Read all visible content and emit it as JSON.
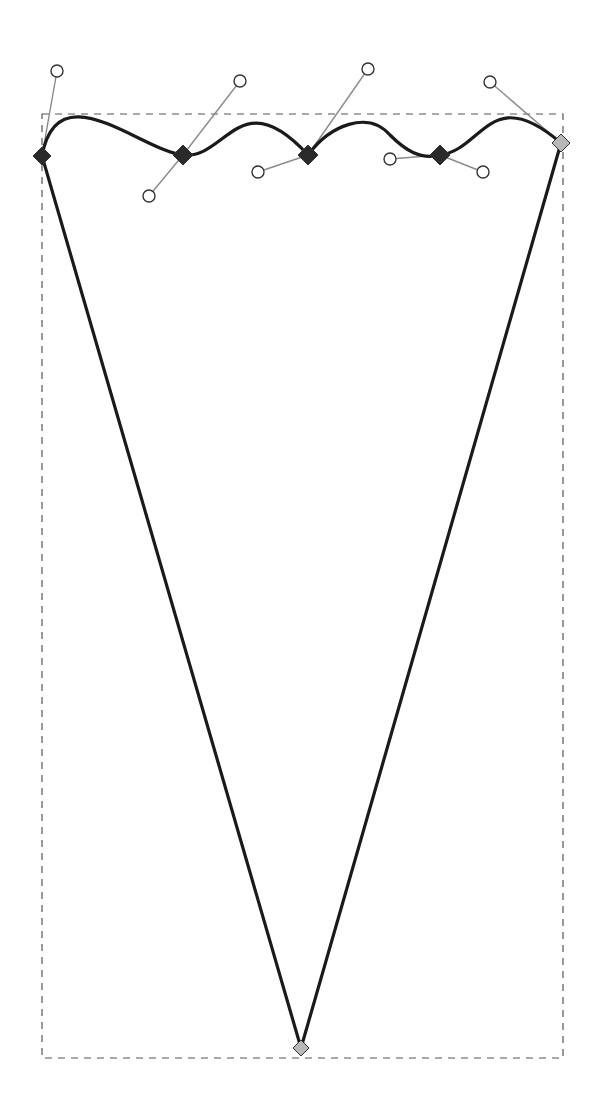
{
  "canvas": {
    "width": 601,
    "height": 1119,
    "background": "#ffffff"
  },
  "colors": {
    "path_stroke": "#1a1a1a",
    "bbox_stroke": "#555555",
    "handle_line": "#8a8a8a",
    "handle_circle_stroke": "#333333",
    "node_selected": "#2a2a2a",
    "node_unselected": "#b8b8b8",
    "node_border": "#333333"
  },
  "bounding_box": {
    "x": 42,
    "y": 114,
    "width": 521,
    "height": 944,
    "style": "dashed"
  },
  "path": {
    "description": "Closed path: wavy top edge with five nodes, two straight sides meeting at bottom point",
    "d": "M 42 156 C 57 71, 140 150, 183 155 C 226 160, 240 81, 308 155 C 330 125, 368 110, 390 135 C 405 150, 420 160, 440 155 C 483 150, 490 82, 561 143 L 301 1048 Z"
  },
  "nodes": [
    {
      "id": "node-1",
      "x": 42,
      "y": 156,
      "selected": true,
      "size": 9
    },
    {
      "id": "node-2",
      "x": 183,
      "y": 155,
      "selected": true,
      "size": 10
    },
    {
      "id": "node-3",
      "x": 308,
      "y": 155,
      "selected": true,
      "size": 10
    },
    {
      "id": "node-4",
      "x": 440,
      "y": 155,
      "selected": true,
      "size": 10
    },
    {
      "id": "node-5",
      "x": 561,
      "y": 143,
      "selected": false,
      "size": 9
    },
    {
      "id": "node-6",
      "x": 301,
      "y": 1048,
      "selected": false,
      "size": 8
    }
  ],
  "handles": [
    {
      "node": "node-1",
      "x": 57,
      "y": 71
    },
    {
      "node": "node-2",
      "x": 149,
      "y": 196
    },
    {
      "node": "node-2",
      "x": 240,
      "y": 81
    },
    {
      "node": "node-3",
      "x": 258,
      "y": 172
    },
    {
      "node": "node-3",
      "x": 368,
      "y": 69
    },
    {
      "node": "node-4",
      "x": 390,
      "y": 159
    },
    {
      "node": "node-4",
      "x": 483,
      "y": 172
    },
    {
      "node": "node-5",
      "x": 490,
      "y": 82
    }
  ]
}
